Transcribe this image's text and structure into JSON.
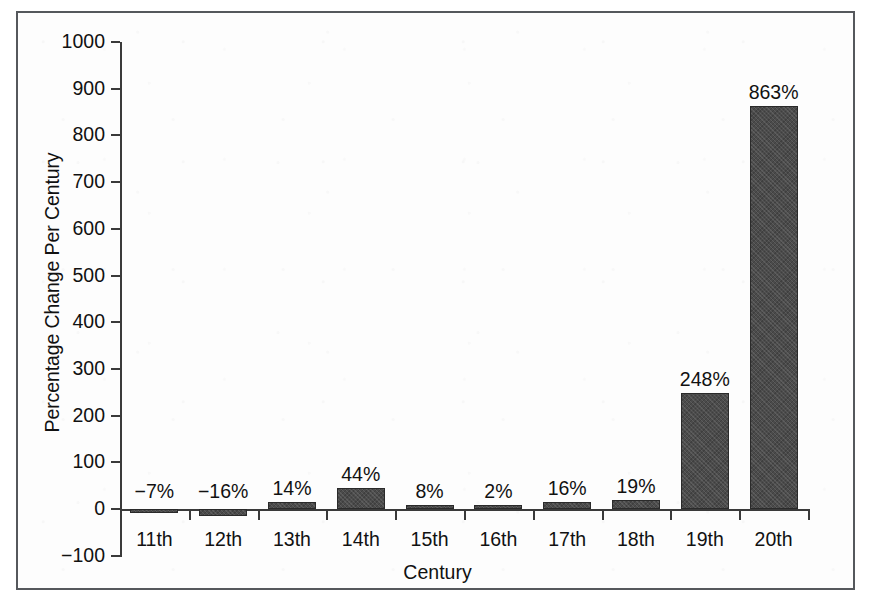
{
  "chart_data": {
    "type": "bar",
    "title": "",
    "xlabel": "Century",
    "ylabel": "Percentage Change Per Century",
    "categories": [
      "11th",
      "12th",
      "13th",
      "14th",
      "15th",
      "16th",
      "17th",
      "18th",
      "19th",
      "20th"
    ],
    "values": [
      -7,
      -16,
      14,
      44,
      8,
      2,
      16,
      19,
      248,
      863
    ],
    "value_labels": [
      "−7%",
      "−16%",
      "14%",
      "44%",
      "8%",
      "2%",
      "16%",
      "19%",
      "248%",
      "863%"
    ],
    "ylim": [
      -100,
      1000
    ],
    "ytick_labels": [
      "1000",
      "900",
      "800",
      "700",
      "600",
      "500",
      "400",
      "300",
      "200",
      "100",
      "0",
      "−100"
    ],
    "ytick_values": [
      1000,
      900,
      800,
      700,
      600,
      500,
      400,
      300,
      200,
      100,
      0,
      -100
    ],
    "grid": false,
    "legend": false,
    "bar_color": "#4b4b4b",
    "axis_color": "#3a3a3a",
    "frame_color": "#55585c",
    "background": "#fdfdfd"
  }
}
